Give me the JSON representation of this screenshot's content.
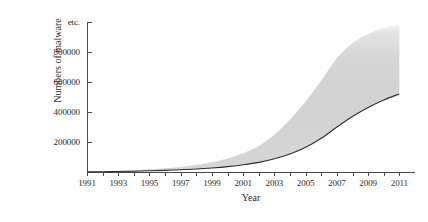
{
  "chart_data": {
    "type": "area",
    "title": "",
    "xlabel": "Year",
    "ylabel": "Numbers of malware",
    "xlim": [
      1991,
      2012
    ],
    "ylim": [
      0,
      1000000
    ],
    "grid": false,
    "legend": null,
    "y_tick_labels": [
      "200000",
      "400000",
      "600000",
      "800000",
      "etc."
    ],
    "y_tick_values": [
      200000,
      400000,
      600000,
      800000,
      1000000
    ],
    "y_axis_truncation_label": "etc.",
    "x_tick_labels": [
      "1991",
      "1993",
      "1995",
      "1997",
      "1999",
      "2001",
      "2003",
      "2005",
      "2007",
      "2009",
      "2011"
    ],
    "x_tick_values": [
      1991,
      1993,
      1995,
      1997,
      1999,
      2001,
      2003,
      2005,
      2007,
      2009,
      2011
    ],
    "x_minor_tick_values": [
      1992,
      1994,
      1996,
      1998,
      2000,
      2002,
      2004,
      2006,
      2008,
      2010
    ],
    "categories": [
      1991,
      1992,
      1993,
      1994,
      1995,
      1996,
      1997,
      1998,
      1999,
      2000,
      2001,
      2002,
      2003,
      2004,
      2005,
      2006,
      2007,
      2008,
      2009,
      2010,
      2011
    ],
    "series": [
      {
        "name": "lower bound",
        "values": [
          1000,
          2000,
          3500,
          5500,
          8000,
          11000,
          15000,
          20000,
          27000,
          36000,
          48000,
          64000,
          88000,
          120000,
          165000,
          225000,
          300000,
          370000,
          430000,
          480000,
          520000
        ]
      },
      {
        "name": "upper bound",
        "values": [
          4000,
          6000,
          9000,
          13000,
          18000,
          25000,
          34000,
          47000,
          65000,
          90000,
          125000,
          175000,
          248000,
          350000,
          470000,
          610000,
          760000,
          860000,
          920000,
          960000,
          985000
        ]
      }
    ],
    "band_style": {
      "fill": "#3a3a3a",
      "upper_edge": "faded",
      "lower_edge": "sharp"
    },
    "axis_color": "#4a4a4a",
    "text_color": "#2b2b2b",
    "background": "#ffffff"
  }
}
